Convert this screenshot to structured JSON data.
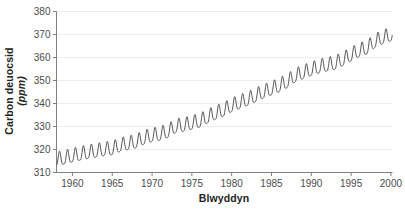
{
  "chart_data": {
    "type": "line",
    "title": "",
    "subtitle": "",
    "xlabel": "Blwyddyn",
    "ylabel": "Carbon deuocsid",
    "ylabel_unit": "(ppm)",
    "xlim": [
      1958,
      2000.2
    ],
    "ylim": [
      310,
      380
    ],
    "xticks": [
      1960,
      1965,
      1970,
      1975,
      1980,
      1985,
      1990,
      1995,
      2000
    ],
    "xtick_labels": [
      "1960",
      "1965",
      "1970",
      "1975",
      "1980",
      "1985",
      "1990",
      "1995",
      "2000"
    ],
    "yticks": [
      310,
      320,
      330,
      340,
      350,
      360,
      370,
      380
    ],
    "ytick_labels": [
      "310",
      "320",
      "330",
      "340",
      "350",
      "360",
      "370",
      "380"
    ],
    "grid": "horizontal",
    "legend": "none",
    "series": [
      {
        "name": "Carbon deuocsid atmosfferig (Mauna Loa)",
        "color": "#555555",
        "annual_mean": {
          "x": [
            1958,
            1959,
            1960,
            1961,
            1962,
            1963,
            1964,
            1965,
            1966,
            1967,
            1968,
            1969,
            1970,
            1971,
            1972,
            1973,
            1974,
            1975,
            1976,
            1977,
            1978,
            1979,
            1980,
            1981,
            1982,
            1983,
            1984,
            1985,
            1986,
            1987,
            1988,
            1989,
            1990,
            1991,
            1992,
            1993,
            1994,
            1995,
            1996,
            1997,
            1998,
            1999,
            2000
          ],
          "y": [
            315.3,
            315.9,
            316.9,
            317.6,
            318.4,
            318.9,
            319.6,
            320.0,
            321.4,
            322.2,
            323.0,
            324.6,
            325.7,
            326.3,
            327.5,
            329.7,
            330.2,
            331.1,
            332.0,
            333.8,
            335.4,
            336.8,
            338.7,
            340.1,
            341.4,
            343.0,
            344.6,
            346.0,
            347.4,
            349.2,
            351.6,
            353.1,
            354.4,
            355.6,
            356.4,
            357.1,
            358.8,
            360.8,
            362.6,
            363.8,
            366.6,
            368.3,
            369.5
          ]
        },
        "seasonal_amplitude_ppm": 3.0,
        "seasonal_peak_month": "May",
        "seasonal_trough_month": "September",
        "first_value_ppm": 315.3,
        "last_value_ppm": 369.5,
        "max_value_ppm": 371.2,
        "min_value_ppm": 313.0
      }
    ]
  },
  "axes": {
    "axis_color": "#808080",
    "grid_color": "#ededed",
    "tick_color": "#808080",
    "tick_label_color": "#4b4b4b"
  }
}
